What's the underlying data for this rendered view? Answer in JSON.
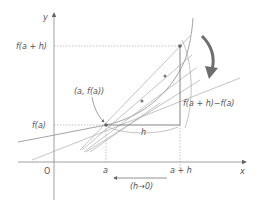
{
  "diagram": {
    "axes": {
      "x_label": "x",
      "y_label": "y",
      "origin_label": "O"
    },
    "x_ticks": [
      {
        "label": "a"
      },
      {
        "label": "a + h"
      }
    ],
    "y_ticks": [
      {
        "label": "f(a + h)"
      },
      {
        "label": "f(a)"
      }
    ],
    "point_label": "(a, f(a))",
    "horizontal_segment_label": "h",
    "vertical_segment_label": "f(a + h)−f(a)",
    "limit_label": "(h→0)",
    "colors": {
      "axis": "#777777",
      "curve": "#999999",
      "secant": "#aaaaaa",
      "arrow": "#6e6e6e",
      "point": "#666666"
    }
  }
}
